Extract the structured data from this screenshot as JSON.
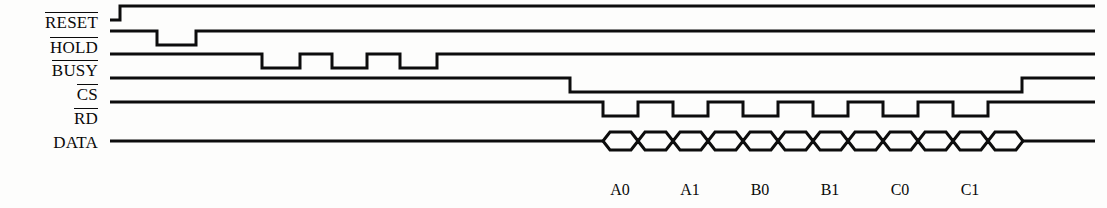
{
  "diagram": {
    "background_color": "#fdfdfc",
    "line_color": "#0d0d0d",
    "width": 1107,
    "height": 208
  },
  "signals": [
    {
      "name": "RESET",
      "label": "RESET",
      "active_low": true,
      "overbar": true,
      "row_y": 20,
      "label_y": 12,
      "initial_level": "low",
      "transitions": [
        {
          "x": 120,
          "level": "high"
        }
      ],
      "start_x": 110,
      "end_x": 1095,
      "description": "Starts low, rises high at x=120 and stays high"
    },
    {
      "name": "HOLD",
      "label": "HOLD",
      "active_low": true,
      "overbar": true,
      "row_y": 45,
      "label_y": 37,
      "initial_level": "high",
      "transitions": [
        {
          "x": 157,
          "level": "low"
        },
        {
          "x": 196,
          "level": "high"
        }
      ],
      "start_x": 110,
      "end_x": 1095,
      "description": "High with one low pulse between x=157 and x=196"
    },
    {
      "name": "BUSY",
      "label": "BUSY",
      "active_low": true,
      "overbar": true,
      "row_y": 68,
      "label_y": 60,
      "initial_level": "high",
      "transitions": [
        {
          "x": 262,
          "level": "low"
        },
        {
          "x": 300,
          "level": "high"
        },
        {
          "x": 332,
          "level": "low"
        },
        {
          "x": 367,
          "level": "high"
        },
        {
          "x": 400,
          "level": "low"
        },
        {
          "x": 437,
          "level": "high"
        }
      ],
      "start_x": 110,
      "end_x": 1095,
      "description": "High with three low pulses"
    },
    {
      "name": "CS",
      "label": "CS",
      "active_low": true,
      "overbar": true,
      "row_y": 92,
      "label_y": 84,
      "initial_level": "high",
      "transitions": [
        {
          "x": 570,
          "level": "low"
        },
        {
          "x": 1022,
          "level": "high"
        }
      ],
      "start_x": 110,
      "end_x": 1095,
      "description": "High, falls low at x=570, returns high at x=1022"
    },
    {
      "name": "RD",
      "label": "RD",
      "active_low": true,
      "overbar": true,
      "row_y": 116,
      "label_y": 108,
      "initial_level": "high",
      "transitions": [
        {
          "x": 603,
          "level": "low"
        },
        {
          "x": 638,
          "level": "high"
        },
        {
          "x": 673,
          "level": "low"
        },
        {
          "x": 708,
          "level": "high"
        },
        {
          "x": 743,
          "level": "low"
        },
        {
          "x": 778,
          "level": "high"
        },
        {
          "x": 813,
          "level": "low"
        },
        {
          "x": 848,
          "level": "high"
        },
        {
          "x": 883,
          "level": "low"
        },
        {
          "x": 918,
          "level": "high"
        },
        {
          "x": 953,
          "level": "low"
        },
        {
          "x": 988,
          "level": "high"
        }
      ],
      "start_x": 110,
      "end_x": 1095,
      "description": "Six active-low read strobe pulses"
    },
    {
      "name": "DATA",
      "label": "DATA",
      "active_low": false,
      "overbar": false,
      "row_y": 141,
      "label_y": 133,
      "type": "bus",
      "start_x": 110,
      "end_x": 1095,
      "bus_start_x": 603,
      "bus_end_x": 1000,
      "cell_width": 35,
      "cell_count": 12,
      "description": "Idle line until x=603, then 12 bus data cells, idle after x=1000"
    }
  ],
  "bus_value_labels": [
    {
      "text": "A0",
      "x": 620,
      "y": 182
    },
    {
      "text": "A1",
      "x": 690,
      "y": 182
    },
    {
      "text": "B0",
      "x": 760,
      "y": 182
    },
    {
      "text": "B1",
      "x": 830,
      "y": 182
    },
    {
      "text": "C0",
      "x": 900,
      "y": 182
    },
    {
      "text": "C1",
      "x": 970,
      "y": 182
    }
  ],
  "geometry": {
    "wave_amplitude": 14,
    "bus_slant": 7,
    "bus_half_height": 9,
    "stroke_width": 3
  }
}
